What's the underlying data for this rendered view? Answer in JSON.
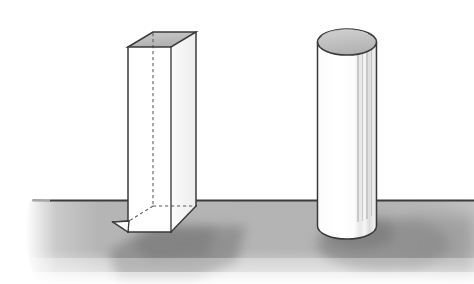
{
  "figure": {
    "caption": "",
    "background_color": "#ffffff"
  },
  "palette": {
    "page_background": "#ffffff",
    "ground_fill": "#b3b3b3",
    "ground_fill_light": "#c6c6c6",
    "horizon_line": "#3b3b3b",
    "outline": "#3a3a3a",
    "outline_soft": "#6e6e6e",
    "top_face_fill": "#b8b8b8",
    "top_face_fill_light": "#cfcfcf",
    "solid_fill": "#fdfdfd",
    "side_face_fill": "#f2f2f2",
    "shadow_fill": "#8e8e8e",
    "shading_line": "#9a9a9a",
    "hidden_edge": "#555555"
  },
  "ground": {
    "name": "ground-plane",
    "horizon_y": 200,
    "left_x": 28,
    "right_x": 474,
    "bottom_y": 284
  },
  "objects": [
    {
      "id": "box",
      "label": "Rectangular prism",
      "shape": "rectangular-prism",
      "style": "transparent-wireframe",
      "front_left_x": 128,
      "front_right_x": 171,
      "front_top_y": 47,
      "front_bottom_y": 221,
      "depth_dx": 25,
      "depth_dy": -15,
      "base_bottom_y": 232,
      "hidden_edges": "dashed",
      "top_face_shaded": true
    },
    {
      "id": "cylinder",
      "label": "Cylinder",
      "shape": "cylinder",
      "style": "solid",
      "center_x": 347,
      "left_x": 318,
      "right_x": 377,
      "top_center_y": 42,
      "ellipse_rx": 29.5,
      "ellipse_ry": 13,
      "bottom_center_y": 226,
      "top_face_shaded": true,
      "shading_lines": 4
    }
  ],
  "shadows": [
    {
      "id": "box-shadow",
      "owner": "box",
      "direction": "lower-right"
    },
    {
      "id": "cylinder-shadow",
      "owner": "cylinder",
      "direction": "lower-right"
    }
  ]
}
